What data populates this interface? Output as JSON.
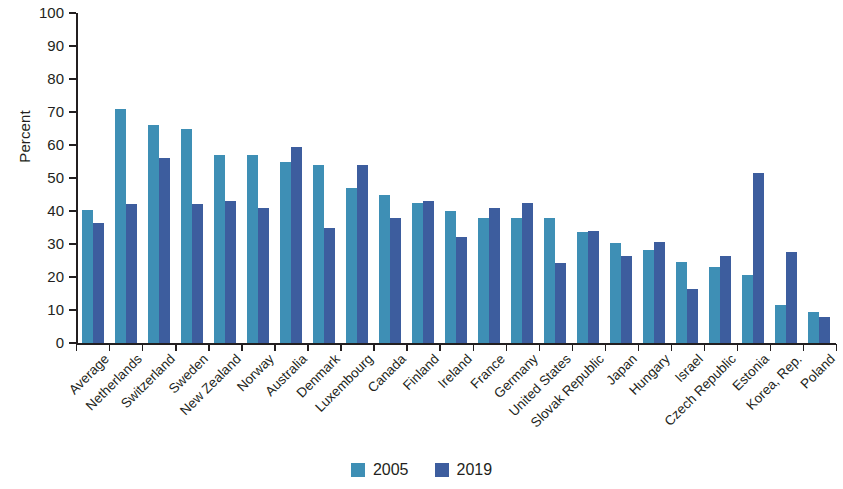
{
  "chart_data": {
    "type": "bar",
    "title": "",
    "subtitle": "",
    "xlabel": "",
    "ylabel": "Percent",
    "ylim": [
      0,
      100
    ],
    "ytick_step": 10,
    "yticks": [
      0,
      10,
      20,
      30,
      40,
      50,
      60,
      70,
      80,
      90,
      100
    ],
    "grid": false,
    "legend_position": "bottom-center",
    "categories": [
      "Average",
      "Netherlands",
      "Switzerland",
      "Sweden",
      "New Zealand",
      "Norway",
      "Australia",
      "Denmark",
      "Luxembourg",
      "Canada",
      "Finland",
      "Ireland",
      "France",
      "Germany",
      "United States",
      "Slovak Republic",
      "Japan",
      "Hungary",
      "Israel",
      "Czech Republic",
      "Estonia",
      "Korea, Rep.",
      "Poland"
    ],
    "series": [
      {
        "name": "2005",
        "color": "#3e8fb5",
        "values": [
          40.3,
          70.8,
          66,
          65,
          57,
          57,
          55,
          54,
          47,
          45,
          42.5,
          40,
          38,
          38,
          38,
          33.5,
          30.3,
          28.3,
          24.5,
          23,
          20.5,
          11.5,
          9.3
        ]
      },
      {
        "name": "2019",
        "color": "#3d5d9e",
        "values": [
          36.5,
          42,
          56,
          42,
          43,
          41,
          59.5,
          35,
          54,
          38,
          43,
          32,
          41,
          42.3,
          24.3,
          34,
          26.5,
          30.5,
          16.5,
          26.3,
          51.5,
          27.5,
          8
        ]
      }
    ]
  },
  "legend": {
    "items": [
      {
        "label": "2005",
        "color": "#3e8fb5"
      },
      {
        "label": "2019",
        "color": "#3d5d9e"
      }
    ]
  }
}
